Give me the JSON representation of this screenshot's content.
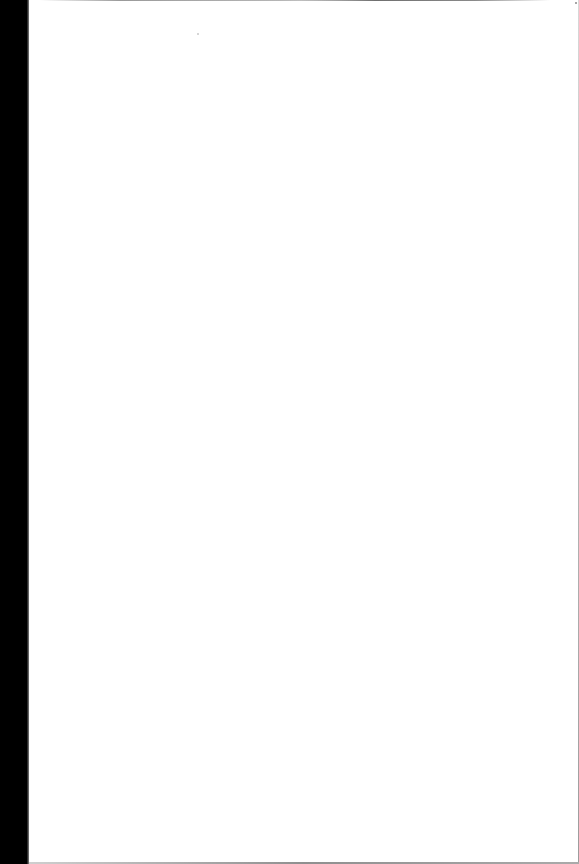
{
  "document": {
    "type": "scanned-page",
    "content": "",
    "colors": {
      "page": "#ffffff",
      "scan_margin": "#000000",
      "edge_shadow": "#9a9a9a"
    }
  }
}
